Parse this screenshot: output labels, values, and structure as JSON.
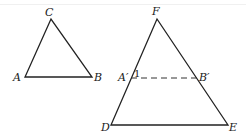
{
  "diagram": {
    "triangle_small": {
      "vertices": {
        "A": {
          "label": "A",
          "x": 25,
          "y": 77
        },
        "B": {
          "label": "B",
          "x": 92,
          "y": 77
        },
        "C": {
          "label": "C",
          "x": 51,
          "y": 19
        }
      }
    },
    "triangle_large": {
      "vertices": {
        "D": {
          "label": "D",
          "x": 111,
          "y": 125
        },
        "E": {
          "label": "E",
          "x": 228,
          "y": 125
        },
        "F": {
          "label": "F",
          "x": 157,
          "y": 19
        }
      },
      "segment": {
        "A_prime": {
          "label": "A′",
          "x": 131,
          "y": 78
        },
        "B_prime": {
          "label": "B′",
          "x": 197,
          "y": 78
        },
        "style": "dashed"
      },
      "angle_mark": {
        "label": "1"
      }
    }
  }
}
